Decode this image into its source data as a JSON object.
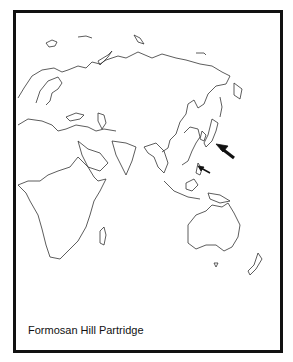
{
  "map": {
    "title": "Formosan Hill Partridge",
    "region": "Eastern Hemisphere (Europe, Africa, Asia, Australia)",
    "markers": [
      {
        "name": "large-arrow",
        "points_to": "Japan region"
      },
      {
        "name": "small-arrow",
        "points_to": "Taiwan"
      }
    ],
    "colors": {
      "outline": "#333333",
      "border": "#111111",
      "background": "#ffffff"
    }
  }
}
